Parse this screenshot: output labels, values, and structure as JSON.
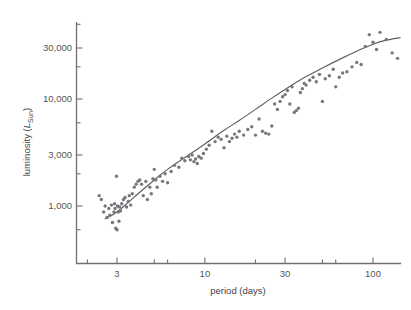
{
  "figure": {
    "name": "period-luminosity-scatter",
    "background_color": "#ffffff",
    "point_color": "#77777e",
    "line_color": "#5e5e63",
    "axis_color": "#6f6f72",
    "text_color": "#4d4d4d"
  },
  "chart_data": {
    "type": "scatter",
    "title": "",
    "subtitle": "",
    "xlabel": "period (days)",
    "ylabel_full": "luminosity (LSun)",
    "ylabel_prefix": "luminosity (",
    "ylabel_symbol": "L",
    "ylabel_subscript": "Sun",
    "ylabel_suffix": ")",
    "xscale": "log",
    "yscale": "log",
    "xlim": [
      2.0,
      160
    ],
    "ylim": [
      450,
      60000
    ],
    "grid": false,
    "legend": null,
    "xticks": [
      3,
      10,
      30,
      100
    ],
    "xtick_labels": [
      "3",
      "10",
      "30",
      "100"
    ],
    "xminor_ticks": [
      2,
      5,
      6,
      20,
      50,
      60,
      150
    ],
    "yticks": [
      1000,
      3000,
      10000,
      30000
    ],
    "ytick_labels": [
      "1,000",
      "3,000",
      "10,000",
      "30,000"
    ],
    "yminor_ticks": [
      600,
      2000,
      6000,
      20000,
      50000
    ],
    "marker_size_px": 3.4,
    "n_points": 120,
    "series": [
      {
        "name": "Cepheid variables",
        "x": [
          2.35,
          2.42,
          2.5,
          2.55,
          2.62,
          2.68,
          2.72,
          2.78,
          2.82,
          2.88,
          2.9,
          2.92,
          2.95,
          2.98,
          3.0,
          3.02,
          3.05,
          3.08,
          3.1,
          3.15,
          3.2,
          3.28,
          3.35,
          3.42,
          3.5,
          3.55,
          3.62,
          3.7,
          3.8,
          3.9,
          4.0,
          4.1,
          4.2,
          4.3,
          4.45,
          4.55,
          4.7,
          4.8,
          4.9,
          5.0,
          5.1,
          5.2,
          5.4,
          5.6,
          5.8,
          6.0,
          6.3,
          6.6,
          7.0,
          7.3,
          7.6,
          8.0,
          8.2,
          8.4,
          8.6,
          8.8,
          9.0,
          9.2,
          9.5,
          9.8,
          10.2,
          10.6,
          11.0,
          11.5,
          12.0,
          12.5,
          13.0,
          13.5,
          14.0,
          14.5,
          15.0,
          15.5,
          16.0,
          17.0,
          18.0,
          19.0,
          20.0,
          21.0,
          22.0,
          23.0,
          24.0,
          25.0,
          26.0,
          27.0,
          28.0,
          29.0,
          30.0,
          31.0,
          32.0,
          33.0,
          34.0,
          35.0,
          36.0,
          37.0,
          38.0,
          39.0,
          40.0,
          42.0,
          44.0,
          46.0,
          48.0,
          50.0,
          52.0,
          55.0,
          58.0,
          60.0,
          63.0,
          66.0,
          70.0,
          75.0,
          80.0,
          85.0,
          90.0,
          95.0,
          100.0,
          105.0,
          110.0,
          120.0,
          130.0,
          140.0
        ],
        "y": [
          1250,
          1150,
          880,
          1000,
          780,
          950,
          820,
          1020,
          700,
          880,
          1050,
          950,
          620,
          1900,
          600,
          1000,
          880,
          720,
          980,
          900,
          1050,
          1150,
          1200,
          980,
          1100,
          1250,
          1020,
          1300,
          1500,
          1600,
          1700,
          1750,
          1600,
          1250,
          1700,
          1150,
          1500,
          1300,
          1800,
          2200,
          1750,
          1500,
          1900,
          1700,
          2000,
          1650,
          2100,
          2400,
          2300,
          2800,
          2650,
          2900,
          2700,
          3000,
          2600,
          2750,
          2500,
          2900,
          2800,
          3100,
          3400,
          3700,
          5000,
          4000,
          4400,
          4200,
          3500,
          4500,
          4000,
          4300,
          4700,
          4400,
          5000,
          4600,
          5200,
          5500,
          4600,
          6500,
          5000,
          4800,
          4700,
          5600,
          9000,
          8000,
          9500,
          10500,
          11000,
          12000,
          9000,
          13000,
          7500,
          7800,
          8200,
          11500,
          12500,
          14000,
          13500,
          15000,
          16000,
          14500,
          17000,
          9500,
          15500,
          16500,
          19000,
          13000,
          16000,
          17500,
          18000,
          20000,
          22000,
          21000,
          31000,
          40000,
          34000,
          29000,
          42000,
          36000,
          27000,
          24000
        ]
      }
    ],
    "fit_curve": {
      "name": "period-luminosity relation",
      "description": "rising log-log trend that flattens at long periods",
      "x": [
        2.55,
        3.0,
        3.5,
        4.0,
        5.0,
        6.0,
        8.0,
        10.0,
        13.0,
        16.0,
        20.0,
        25.0,
        30.0,
        40.0,
        50.0,
        65.0,
        80.0,
        100.0,
        120.0,
        145.0
      ],
      "y": [
        760,
        880,
        1080,
        1300,
        1750,
        2200,
        3000,
        3800,
        5100,
        6300,
        8000,
        10200,
        12300,
        16200,
        19500,
        24000,
        28000,
        32500,
        35500,
        37500
      ]
    }
  }
}
